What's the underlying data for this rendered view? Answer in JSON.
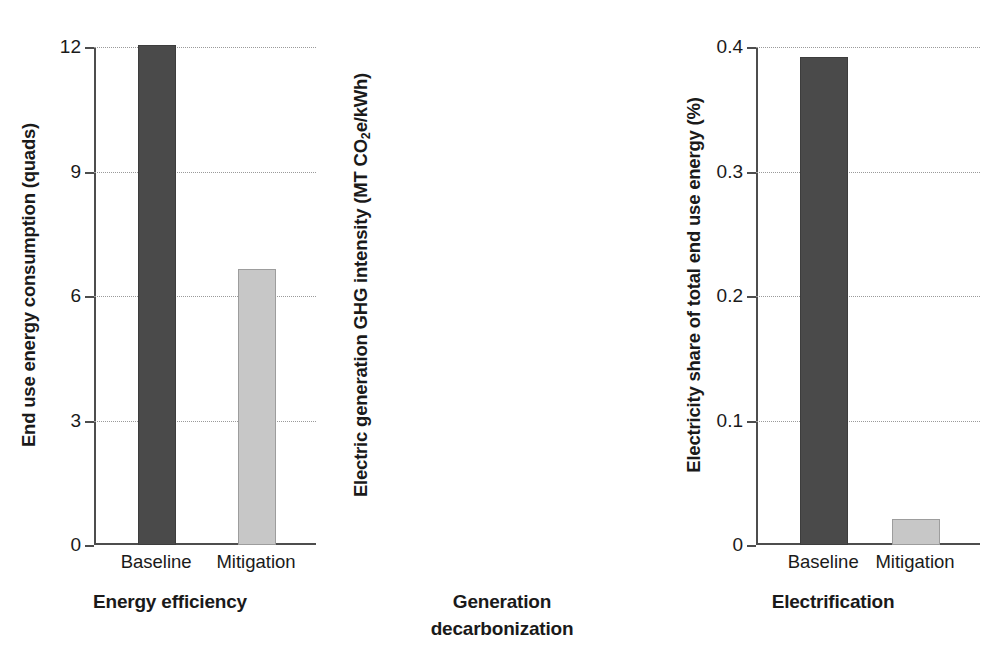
{
  "chart_data": {
    "type": "bar",
    "title": "",
    "layout": "three side-by-side single-axis bar panels, no legend, horizontal dotted gridlines at each labeled y tick",
    "grid": true,
    "legend": null,
    "categories": [
      "Baseline",
      "Mitigation"
    ],
    "series_colors": {
      "Baseline": "#4a4a4a",
      "Mitigation": "#c7c7c7"
    },
    "panels": [
      {
        "id": "energy-efficiency",
        "xlabel": "Energy efficiency",
        "xlabel_lines": [
          "Energy efficiency"
        ],
        "ylabel": "End use energy consumption (quads)",
        "ylabel_html": "End use energy consumption (quads)",
        "ylim": [
          0,
          12
        ],
        "yticks": [
          0,
          3,
          6,
          9,
          12
        ],
        "yticklabels": [
          "0",
          "3",
          "6",
          "9",
          "12"
        ],
        "categories": [
          "Baseline",
          "Mitigation"
        ],
        "values": [
          12.0,
          6.6
        ]
      },
      {
        "id": "generation-decarbonization",
        "xlabel": "Generation decarbonization",
        "xlabel_lines": [
          "Generation",
          "decarbonization"
        ],
        "ylabel": "Electric generation GHG intensity (MT CO2e/kWh)",
        "ylabel_html": "Electric generation GHG intensity (MT CO<sub>2</sub>e/kWh)",
        "ylim": [
          0,
          0.4
        ],
        "yticks": [
          0,
          0.1,
          0.2,
          0.3,
          0.4
        ],
        "yticklabels": [
          "0",
          "0.1",
          "0.2",
          "0.3",
          "0.4"
        ],
        "categories": [
          "Baseline",
          "Mitigation"
        ],
        "values": [
          0.39,
          0.019
        ]
      },
      {
        "id": "electrification",
        "xlabel": "Electrification",
        "xlabel_lines": [
          "Electrification"
        ],
        "ylabel": "Electricity share of total end use energy (%)",
        "ylabel_html": "Electricity share of total end use energy (%)",
        "ylim": [
          0,
          60
        ],
        "yticks": [
          0,
          20,
          40,
          60
        ],
        "yticklabels": [
          "0",
          "20",
          "40",
          "60"
        ],
        "categories": [
          "Baseline",
          "Mitigation"
        ],
        "values": [
          15.1,
          54.7
        ]
      }
    ]
  }
}
